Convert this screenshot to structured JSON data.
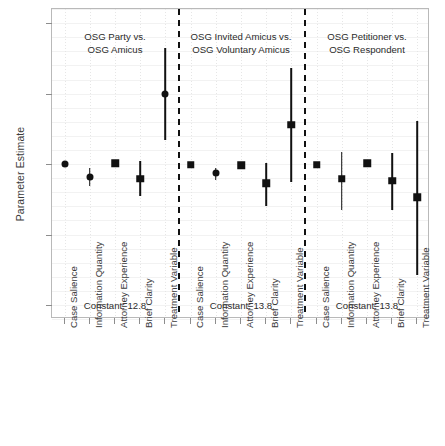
{
  "chart_data": {
    "type": "scatter",
    "title": "",
    "xlabel": "",
    "ylabel": "Parameter Estimate",
    "ylim": [
      -2.2,
      2.2
    ],
    "yticks": [
      2,
      1,
      0,
      -1,
      -2
    ],
    "ytick_labels": [
      "2",
      "1",
      "0",
      "-1",
      "-2"
    ],
    "grid": true,
    "legend": "none",
    "orientation": "coefficient-plot",
    "panels": [
      {
        "title_line1": "OSG Party vs.",
        "title_line2": "OSG Amicus",
        "constant_label": "Constant: 12.8",
        "constant_value": 12.8,
        "points": [
          {
            "label": "Case Salience",
            "estimate": 0.0,
            "ci_low": 0.0,
            "ci_high": 0.0,
            "marker": "circle"
          },
          {
            "label": "Information Quantity",
            "estimate": -0.18,
            "ci_low": -0.31,
            "ci_high": -0.06,
            "marker": "circle"
          },
          {
            "label": "Attorney Experience",
            "estimate": 0.01,
            "ci_low": 0.01,
            "ci_high": 0.01,
            "marker": "square"
          },
          {
            "label": "Brief Clarity",
            "estimate": -0.21,
            "ci_low": -0.46,
            "ci_high": 0.04,
            "marker": "square"
          },
          {
            "label": "Treatment Variable",
            "estimate": 0.99,
            "ci_low": 0.34,
            "ci_high": 1.65,
            "marker": "circle"
          }
        ]
      },
      {
        "title_line1": "OSG Invited Amicus vs.",
        "title_line2": "OSG Voluntary Amicus",
        "constant_label": "Constant: 13.8",
        "constant_value": 13.8,
        "points": [
          {
            "label": "Case Salience",
            "estimate": -0.01,
            "ci_low": -0.01,
            "ci_high": -0.01,
            "marker": "square"
          },
          {
            "label": "Information Quantity",
            "estimate": -0.13,
            "ci_low": -0.22,
            "ci_high": -0.05,
            "marker": "circle"
          },
          {
            "label": "Attorney Experience",
            "estimate": -0.02,
            "ci_low": -0.02,
            "ci_high": -0.02,
            "marker": "square"
          },
          {
            "label": "Brief Clarity",
            "estimate": -0.27,
            "ci_low": -0.59,
            "ci_high": 0.02,
            "marker": "square"
          },
          {
            "label": "Treatment Variable",
            "estimate": 0.56,
            "ci_low": -0.25,
            "ci_high": 1.37,
            "marker": "square"
          }
        ]
      },
      {
        "title_line1": "OSG Petitioner vs.",
        "title_line2": "OSG Respondent",
        "constant_label": "Constant: 13.8",
        "constant_value": 13.8,
        "points": [
          {
            "label": "Case Salience",
            "estimate": -0.01,
            "ci_low": -0.01,
            "ci_high": -0.01,
            "marker": "square"
          },
          {
            "label": "Information Quantity",
            "estimate": -0.21,
            "ci_low": -0.65,
            "ci_high": 0.17,
            "marker": "square"
          },
          {
            "label": "Attorney Experience",
            "estimate": 0.01,
            "ci_low": 0.01,
            "ci_high": 0.01,
            "marker": "square"
          },
          {
            "label": "Brief Clarity",
            "estimate": -0.24,
            "ci_low": -0.66,
            "ci_high": 0.16,
            "marker": "square"
          },
          {
            "label": "Treatment Variable",
            "estimate": -0.47,
            "ci_low": -1.57,
            "ci_high": 0.61,
            "marker": "square"
          }
        ]
      }
    ]
  },
  "axis": {
    "y_title": "Parameter Estimate"
  }
}
